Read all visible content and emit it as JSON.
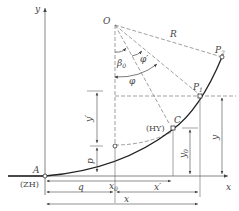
{
  "diagram": {
    "colors": {
      "line": "#555555",
      "curve": "#222222",
      "dash": "#777777",
      "text": "#444444",
      "background": "#ffffff"
    },
    "axes": {
      "x_label": "x",
      "y_label": "y"
    },
    "points": {
      "origin_center": "O",
      "start": "A",
      "start_code": "(ZH)",
      "transition_end": "C",
      "transition_end_code": "(HY)",
      "p1": "P",
      "p1_sub": "1",
      "p2": "P",
      "p2_sub": "2"
    },
    "angles": {
      "beta0": "β",
      "beta0_sub": "0",
      "phi_prime": "φ′",
      "phi": "φ"
    },
    "dimensions": {
      "radius": "R",
      "shift_p": "p",
      "y_prime": "y′",
      "y0": "y",
      "y0_sub": "0",
      "y": "y",
      "x0": "x",
      "x0_sub": "0",
      "q": "q",
      "x_prime": "x′",
      "x": "x"
    },
    "caption": ""
  }
}
